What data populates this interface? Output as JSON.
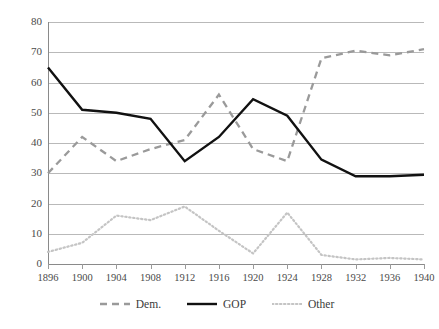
{
  "chart_data": {
    "type": "line",
    "title": "",
    "subtitle": "",
    "xlabel": "",
    "ylabel": "",
    "x": [
      1896,
      1900,
      1904,
      1908,
      1912,
      1916,
      1920,
      1924,
      1928,
      1932,
      1936,
      1940
    ],
    "xtick_labels": [
      "1896",
      "1900",
      "1904",
      "1908",
      "1912",
      "1916",
      "1920",
      "1924",
      "1928",
      "1932",
      "1936",
      "1940"
    ],
    "ytick_labels": [
      "0",
      "10",
      "20",
      "30",
      "40",
      "50",
      "60",
      "70",
      "80"
    ],
    "yticks": [
      0,
      10,
      20,
      30,
      40,
      50,
      60,
      70,
      80
    ],
    "ylim": [
      0,
      80
    ],
    "xlim": [
      1896,
      1940
    ],
    "grid": "horizontal",
    "legend_position": "bottom-center",
    "series": [
      {
        "name": "Dem.",
        "style": "dashed",
        "color": "#9a9a9a",
        "values": [
          30,
          42,
          34,
          38,
          41,
          56,
          38,
          34,
          68,
          70.5,
          69,
          71
        ]
      },
      {
        "name": "GOP",
        "style": "solid",
        "color": "#111111",
        "values": [
          65,
          51,
          50,
          48,
          34,
          42,
          54.5,
          49,
          34.5,
          29,
          29,
          29.5
        ]
      },
      {
        "name": "Other",
        "style": "dotted",
        "color": "#c4c4c4",
        "values": [
          4,
          7,
          16,
          14.5,
          19,
          11,
          3.5,
          17,
          3,
          1.5,
          2,
          1.5
        ]
      }
    ]
  },
  "legend": {
    "items": [
      {
        "label": "Dem.",
        "swatch": "dashed-line-swatch"
      },
      {
        "label": "GOP",
        "swatch": "solid-line-swatch"
      },
      {
        "label": "Other",
        "swatch": "dotted-line-swatch"
      }
    ]
  }
}
